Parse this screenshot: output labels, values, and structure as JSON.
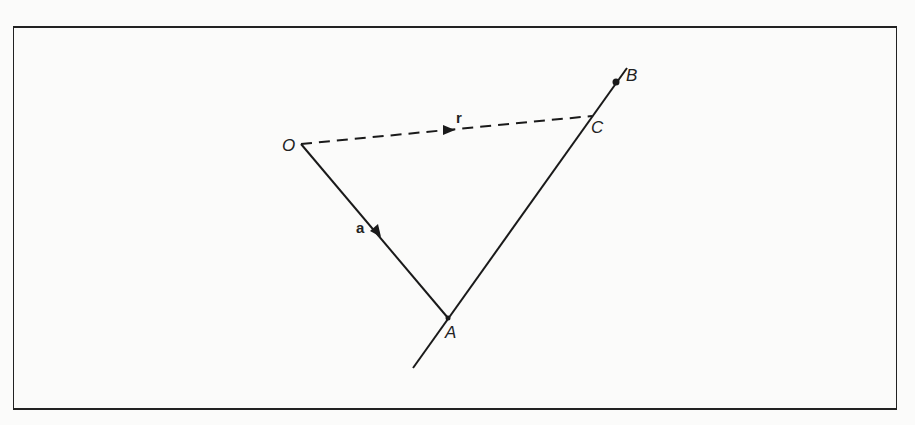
{
  "diagram": {
    "points": {
      "O": {
        "label": "O",
        "x": 301,
        "y": 144
      },
      "A": {
        "label": "A",
        "x": 448,
        "y": 318
      },
      "B": {
        "label": "B",
        "x": 616,
        "y": 81
      },
      "C": {
        "label": "C",
        "x": 592,
        "y": 116
      }
    },
    "vectors": {
      "a": {
        "label": "a",
        "from": "O",
        "to": "A",
        "style": "solid"
      },
      "r": {
        "label": "r",
        "from": "O",
        "to": "C",
        "style": "dashed"
      }
    },
    "line": {
      "through": [
        "A",
        "B"
      ],
      "style": "solid"
    }
  }
}
